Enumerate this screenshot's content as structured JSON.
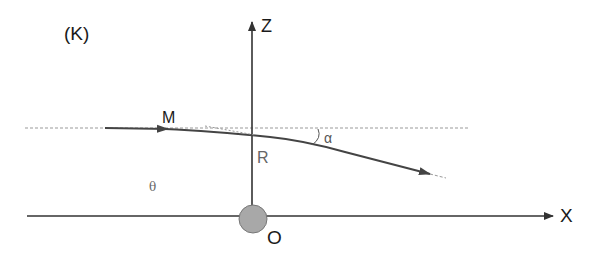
{
  "diagram": {
    "frame_label": "(K)",
    "axes": {
      "z_label": "Z",
      "x_label": "X",
      "origin_label": "O"
    },
    "points": {
      "m_label": "M",
      "r_label": "R"
    },
    "angles": {
      "alpha_label": "α",
      "theta_label": "θ"
    },
    "colors": {
      "axis": "#333333",
      "trajectory": "#444444",
      "dashed": "#888888",
      "origin_mass_fill": "#a8a8a8",
      "origin_mass_stroke": "#777777",
      "text": "#1a1a1a",
      "secondary_text": "#666666"
    }
  }
}
